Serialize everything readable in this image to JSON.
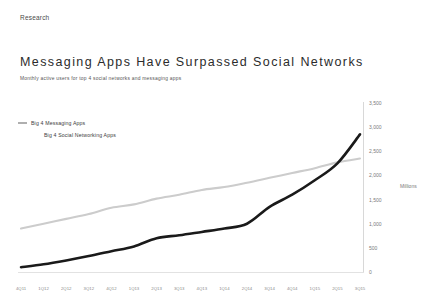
{
  "kicker": "Research",
  "title": "Messaging Apps Have Surpassed Social Networks",
  "subtitle": "Monthly active users for top 4 social networks and messaging apps",
  "legend": {
    "items": [
      {
        "label": "Big 4 Messaging Apps",
        "color": "#1a1a1a"
      },
      {
        "label": "Big 4 Social Networking Apps",
        "color": "#cccccc"
      }
    ]
  },
  "axis": {
    "y_label": "Millions",
    "y_ticks": [
      "3,500",
      "3,000",
      "2,500",
      "2,000",
      "1,500",
      "1,000",
      "500",
      "0"
    ]
  },
  "chart_data": {
    "type": "line",
    "title": "Messaging Apps Have Surpassed Social Networks",
    "subtitle": "Monthly active users for top 4 social networks and messaging apps",
    "xlabel": "",
    "ylabel": "Millions",
    "ylim": [
      0,
      3500
    ],
    "grid": false,
    "legend_position": "top-left",
    "x": [
      "4Q11",
      "1Q12",
      "2Q12",
      "3Q12",
      "4Q12",
      "1Q13",
      "2Q13",
      "3Q13",
      "4Q13",
      "1Q14",
      "2Q14",
      "3Q14",
      "4Q14",
      "1Q15",
      "2Q15",
      "3Q15"
    ],
    "series": [
      {
        "name": "Big 4 Messaging Apps",
        "color": "#1a1a1a",
        "values": [
          100,
          160,
          240,
          330,
          430,
          530,
          700,
          760,
          830,
          900,
          1000,
          1350,
          1600,
          1900,
          2250,
          2850
        ]
      },
      {
        "name": "Big 4 Social Networking Apps",
        "color": "#cccccc",
        "values": [
          900,
          1000,
          1100,
          1200,
          1330,
          1400,
          1520,
          1600,
          1700,
          1760,
          1850,
          1950,
          2050,
          2150,
          2270,
          2350
        ]
      }
    ]
  }
}
